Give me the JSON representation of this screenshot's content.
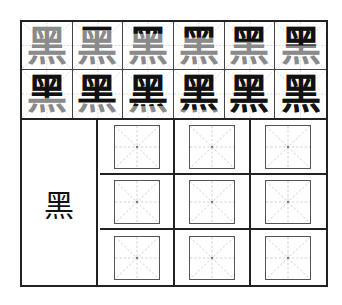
{
  "worksheet": {
    "character": "黑",
    "pinyin_meaning": "",
    "total_strokes": 12,
    "colors": {
      "frame": "#222222",
      "completed_stroke": "#111111",
      "remaining_stroke": "#8a8a8a",
      "guide_line": "#bbbbbb",
      "practice_box_border": "#555555"
    },
    "stroke_order_cells": [
      {
        "char": "黑",
        "strokes_shown": 1
      },
      {
        "char": "黑",
        "strokes_shown": 2
      },
      {
        "char": "黑",
        "strokes_shown": 3
      },
      {
        "char": "黑",
        "strokes_shown": 4
      },
      {
        "char": "黑",
        "strokes_shown": 5
      },
      {
        "char": "黑",
        "strokes_shown": 6
      },
      {
        "char": "黑",
        "strokes_shown": 7
      },
      {
        "char": "黑",
        "strokes_shown": 8
      },
      {
        "char": "黑",
        "strokes_shown": 9
      },
      {
        "char": "黑",
        "strokes_shown": 10
      },
      {
        "char": "黑",
        "strokes_shown": 11
      },
      {
        "char": "黑",
        "strokes_shown": 12
      }
    ],
    "model_character": "黑",
    "practice_boxes": {
      "rows": 3,
      "columns": 3,
      "content": [
        "",
        "",
        "",
        "",
        "",
        "",
        "",
        "",
        ""
      ]
    }
  }
}
